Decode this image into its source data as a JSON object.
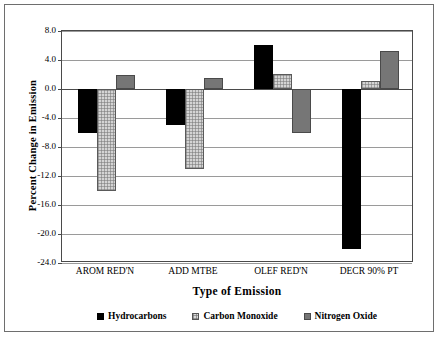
{
  "chart_data": {
    "type": "bar",
    "title": "",
    "xlabel": "Type of Emission",
    "ylabel": "Percent Change in Emission",
    "categories": [
      "AROM RED'N",
      "ADD MTBE",
      "OLEF RED'N",
      "DECR 90% PT"
    ],
    "series": [
      {
        "name": "Hydrocarbons",
        "color": "#000000",
        "values": [
          -6.0,
          -5.0,
          6.1,
          -22.0
        ]
      },
      {
        "name": "Carbon Monoxide",
        "color": "#d4d4d4",
        "values": [
          -14.0,
          -11.0,
          2.1,
          1.1
        ]
      },
      {
        "name": "Nitrogen Oxide",
        "color": "#767676",
        "values": [
          2.0,
          1.5,
          -6.0,
          5.2
        ]
      }
    ],
    "ylim": [
      -24.0,
      8.0
    ],
    "ytick_labels": [
      "8.0",
      "4.0",
      "0.0",
      "-4.0",
      "-8.0",
      "-12.0",
      "-16.0",
      "-20.0",
      "-24.0"
    ],
    "ytick_values": [
      8.0,
      4.0,
      0.0,
      -4.0,
      -8.0,
      -12.0,
      -16.0,
      -20.0,
      -24.0
    ],
    "grid": true,
    "legend_position": "bottom"
  }
}
